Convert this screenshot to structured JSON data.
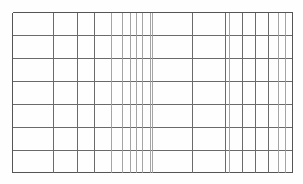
{
  "document": {
    "kind": "blank-ruled-grid-table",
    "title": "Blank grid table",
    "background_color": "#fefefe",
    "line_color": "#6a6a6a",
    "line_color_light": "#9a9a9a",
    "border_color": "#555555",
    "width": 303,
    "height": 184
  },
  "grid": {
    "left": 12,
    "right": 292,
    "top": 12,
    "bottom": 172,
    "row_count": 7,
    "column_count": 19,
    "horizontal_lines": [
      12,
      35,
      58,
      81,
      104,
      127,
      150,
      172
    ],
    "vertical_lines": [
      12,
      53,
      77,
      94,
      111,
      122,
      130,
      136,
      142,
      150,
      152,
      192,
      225,
      229,
      242,
      255,
      268,
      278,
      285,
      292
    ],
    "row_labels": [
      "row-1",
      "row-2",
      "row-3",
      "row-4",
      "row-5",
      "row-6",
      "row-7"
    ],
    "column_labels": [
      "col-1",
      "col-2",
      "col-3",
      "col-4",
      "col-5",
      "col-6",
      "col-7",
      "col-8",
      "col-9",
      "col-10",
      "col-11",
      "col-12",
      "col-13",
      "col-14",
      "col-15",
      "col-16",
      "col-17",
      "col-18",
      "col-19"
    ],
    "cells_empty": true,
    "stroke_widths": {
      "major": 1.1,
      "minor": 0.9,
      "border": 1.2
    }
  }
}
